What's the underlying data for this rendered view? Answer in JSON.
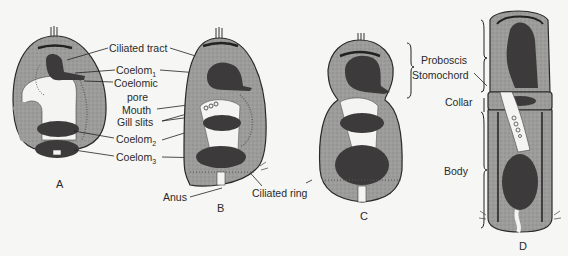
{
  "figure": {
    "panels": [
      {
        "id": "A",
        "label": "A"
      },
      {
        "id": "B",
        "label": "B"
      },
      {
        "id": "C",
        "label": "C"
      },
      {
        "id": "D",
        "label": "D"
      }
    ],
    "labels": {
      "ciliated_tract": "Ciliated tract",
      "coelom1": "Coelom",
      "coelom1_sub": "1",
      "coelomic_pore_line1": "Coelomic",
      "coelomic_pore_line2": "pore",
      "mouth": "Mouth",
      "gill_slits": "Gill slits",
      "coelom2": "Coelom",
      "coelom2_sub": "2",
      "coelom3": "Coelom",
      "coelom3_sub": "3",
      "anus": "Anus",
      "ciliated_ring": "Ciliated ring",
      "proboscis": "Proboscis",
      "stomochord": "Stomochord",
      "collar": "Collar",
      "body": "Body"
    },
    "colors": {
      "background": "#f6f6f4",
      "body_tissue": "#9a9a98",
      "coelom": "#3c3a3a",
      "outline": "#2a2a2a",
      "cavity": "#f4f4f2"
    }
  }
}
